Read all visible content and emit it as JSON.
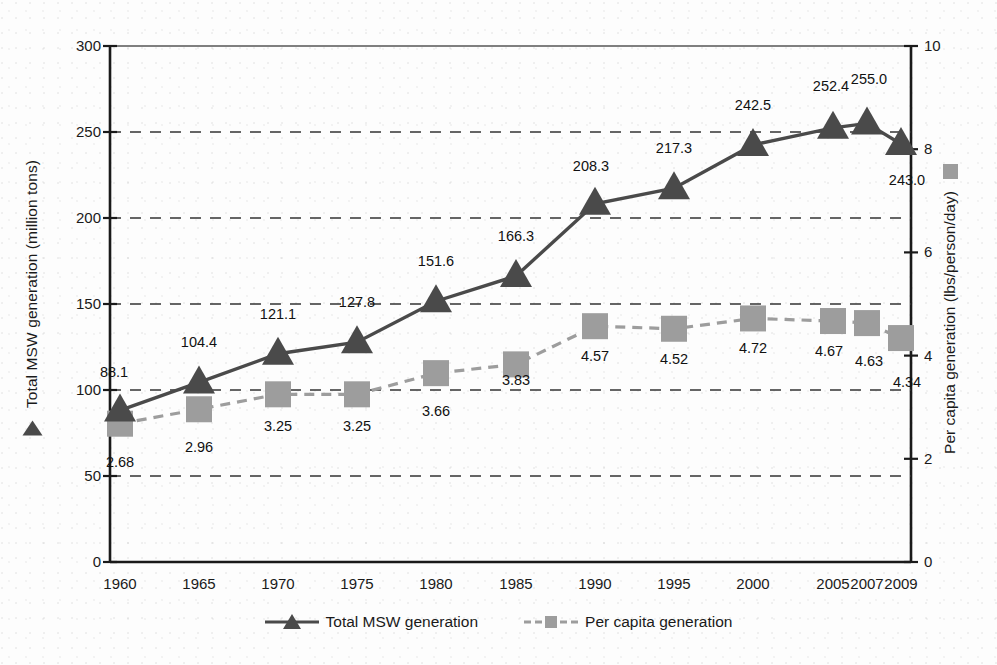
{
  "chart_data": {
    "type": "line",
    "title": "",
    "xlabel": "",
    "ylabel": "Total MSW generation (million tons)",
    "y2label": "Per capita generation (lbs/person/day)",
    "categories": [
      "1960",
      "1965",
      "1970",
      "1975",
      "1980",
      "1985",
      "1990",
      "1995",
      "2000",
      "2005",
      "2007",
      "2009"
    ],
    "x_positions": [
      120,
      199,
      278,
      357,
      436,
      516,
      595,
      674,
      753,
      833,
      867,
      901
    ],
    "ylim": [
      0,
      300
    ],
    "y2lim": [
      0,
      10
    ],
    "yticks": [
      "0",
      "50",
      "100",
      "150",
      "200",
      "250",
      "300"
    ],
    "y2ticks": [
      "0",
      "2",
      "4",
      "6",
      "8",
      "10"
    ],
    "grid": "dashed-horizontal",
    "legend_position": "bottom-center",
    "series": [
      {
        "name": "Total MSW generation",
        "axis": "left",
        "marker": "triangle",
        "line": "solid",
        "color": "#4a4a4a",
        "values": [
          88.1,
          104.4,
          121.1,
          127.8,
          151.6,
          166.3,
          208.3,
          217.3,
          242.5,
          252.4,
          255.0,
          243.0
        ],
        "labels": [
          "88.1",
          "104.4",
          "121.1",
          "127.8",
          "151.6",
          "166.3",
          "208.3",
          "217.3",
          "242.5",
          "252.4",
          "255.0",
          "243.0"
        ]
      },
      {
        "name": "Per capita generation",
        "axis": "right",
        "marker": "square",
        "line": "dashed",
        "color": "#9d9d9d",
        "values": [
          2.68,
          2.96,
          3.25,
          3.25,
          3.66,
          3.83,
          4.57,
          4.52,
          4.72,
          4.67,
          4.63,
          4.34
        ],
        "labels": [
          "2.68",
          "2.96",
          "3.25",
          "3.25",
          "3.66",
          "3.83",
          "4.57",
          "4.52",
          "4.72",
          "4.67",
          "4.63",
          "4.34"
        ]
      }
    ]
  },
  "axes": {
    "left_label": "Total MSW generation (million tons)",
    "right_label": "Per capita generation (lbs/person/day)",
    "left_ticks": [
      "300",
      "250",
      "200",
      "150",
      "100",
      "50",
      "0"
    ],
    "right_ticks": [
      "10",
      "8",
      "6",
      "4",
      "2",
      "0"
    ],
    "x_ticks": [
      "1960",
      "1965",
      "1970",
      "1975",
      "1980",
      "1985",
      "1990",
      "1995",
      "2000",
      "2005",
      "2007",
      "2009"
    ]
  },
  "legend": {
    "items": [
      {
        "label": "Total MSW generation",
        "marker": "triangle",
        "color": "#4a4a4a"
      },
      {
        "label": "Per capita generation",
        "marker": "square",
        "color": "#9d9d9d"
      }
    ]
  },
  "colors": {
    "total_series": "#4a4a4a",
    "percapita_series": "#9d9d9d",
    "axis": "#1a1a1a",
    "grid": "#333333",
    "background": "#fdfdfd"
  }
}
